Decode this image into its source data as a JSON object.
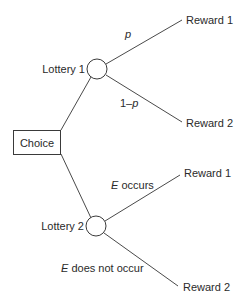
{
  "diagram": {
    "type": "decision-tree",
    "root": {
      "label": "Choice"
    },
    "lotteries": [
      {
        "label": "Lottery 1",
        "branches": [
          {
            "prob_label_italic": "p",
            "prob_label_rest": "",
            "prob_prefix": "",
            "reward": "Reward 1"
          },
          {
            "prob_prefix": "1–",
            "prob_label_italic": "p",
            "prob_label_rest": "",
            "reward": "Reward 2"
          }
        ]
      },
      {
        "label": "Lottery 2",
        "branches": [
          {
            "prob_prefix": "",
            "prob_label_italic": "E",
            "prob_label_rest": " occurs",
            "reward": "Reward 1"
          },
          {
            "prob_prefix": "",
            "prob_label_italic": "E",
            "prob_label_rest": " does not occur",
            "reward": "Reward 2"
          }
        ]
      }
    ],
    "colors": {
      "line": "#4a4a4a",
      "text": "#2a2a2a",
      "background": "#ffffff"
    }
  }
}
